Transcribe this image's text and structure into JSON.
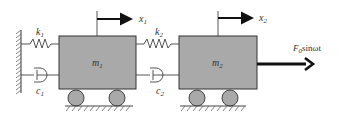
{
  "diagram": {
    "type": "two-mass spring-damper system",
    "masses": [
      {
        "label": "m",
        "sub": "1"
      },
      {
        "label": "m",
        "sub": "2"
      }
    ],
    "springs": [
      {
        "label": "k",
        "sub": "1"
      },
      {
        "label": "k",
        "sub": "2"
      }
    ],
    "dampers": [
      {
        "label": "c",
        "sub": "1"
      },
      {
        "label": "c",
        "sub": "2"
      }
    ],
    "displacements": [
      {
        "label": "x",
        "sub": "1"
      },
      {
        "label": "x",
        "sub": "2"
      }
    ],
    "force": {
      "prefix": "F",
      "sub": "0",
      "suffix": "sinωt"
    },
    "colors": {
      "mass_fill": "#a9a9a9",
      "wheel_fill": "#a9a9a9",
      "line": "#333333"
    }
  }
}
